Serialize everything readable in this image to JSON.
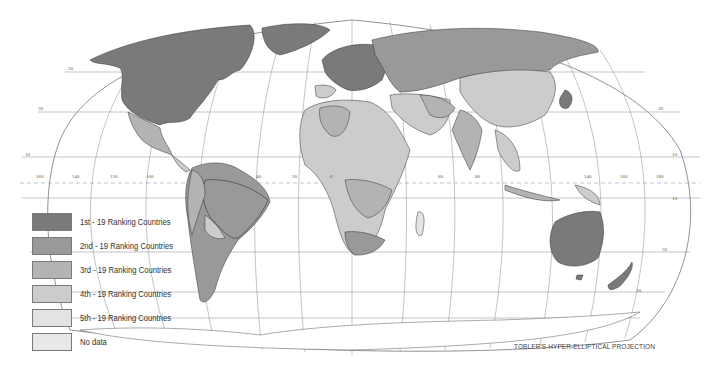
{
  "map": {
    "projection_caption": "TOBLER'S HYPER-ELLIPTICAL PROJECTION",
    "longitude_labels": [
      "160",
      "140",
      "120",
      "100",
      "40",
      "20",
      "0",
      "60",
      "80",
      "140",
      "160",
      "180"
    ],
    "latitude_labels_left": [
      "50",
      "30",
      "10"
    ],
    "latitude_labels_right": [
      "30",
      "10",
      "10",
      "30",
      "50"
    ],
    "colors": {
      "rank1": "#7a7a7a",
      "rank2": "#999999",
      "rank3": "#b3b3b3",
      "rank4": "#cccccc",
      "rank5": "#e3e3e3",
      "nodata": "#e8e8e8",
      "grid": "#8a8a8a",
      "border": "#333333"
    }
  },
  "legend": {
    "items": [
      {
        "label": "1st - 19 Ranking Countries",
        "color": "#7a7a7a"
      },
      {
        "label": "2nd - 19 Ranking Countries",
        "color": "#999999"
      },
      {
        "label": "3rd - 19 Ranking Countries",
        "color": "#b3b3b3"
      },
      {
        "label": "4th - 19 Ranking Countries",
        "color": "#cccccc"
      },
      {
        "label": "5th - 19 Ranking Countries",
        "color": "#e3e3e3"
      },
      {
        "label": "No data",
        "color": "#e8e8e8"
      }
    ]
  }
}
